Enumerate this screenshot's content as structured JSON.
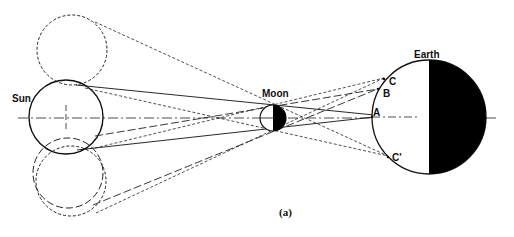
{
  "diagram": {
    "labels": {
      "sun": "Sun",
      "moon": "Moon",
      "earth": "Earth",
      "point_a": "A",
      "point_b": "B",
      "point_c": "C",
      "point_c_prime": "C'",
      "caption": "(a)"
    },
    "colors": {
      "ink": "#111111",
      "background": "#ffffff",
      "night_side": "#000000"
    }
  }
}
